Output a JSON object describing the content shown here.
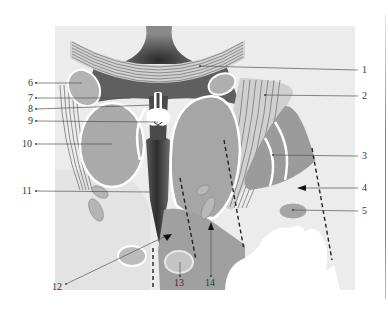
{
  "figure": {
    "colors": {
      "background_panel": "#ececec",
      "tissue_light": "#d9d9d9",
      "organ_gray": "#a9a9a9",
      "organ_dark": "#8c8c8c",
      "cavity_dark": "#3a3a3a",
      "outline_white": "#ffffff",
      "label_text": "#333333"
    },
    "callouts": [
      {
        "id": "1",
        "label": "1",
        "text_x": 362,
        "text_y": 73,
        "line": [
          [
            200,
            66
          ],
          [
            358,
            70
          ]
        ]
      },
      {
        "id": "2",
        "label": "2",
        "text_x": 362,
        "text_y": 99,
        "line": [
          [
            265,
            95
          ],
          [
            358,
            96
          ]
        ]
      },
      {
        "id": "3",
        "label": "3",
        "text_x": 362,
        "text_y": 159,
        "line": [
          [
            273,
            155
          ],
          [
            358,
            156
          ]
        ]
      },
      {
        "id": "4",
        "label": "4",
        "text_x": 362,
        "text_y": 191,
        "line": [
          [
            305,
            188
          ],
          [
            358,
            188
          ]
        ]
      },
      {
        "id": "5",
        "label": "5",
        "text_x": 362,
        "text_y": 214,
        "line": [
          [
            293,
            210
          ],
          [
            358,
            211
          ]
        ]
      },
      {
        "id": "6",
        "label": "6",
        "text_x": 28,
        "text_y": 86,
        "line": [
          [
            36,
            83
          ],
          [
            82,
            83
          ]
        ]
      },
      {
        "id": "7",
        "label": "7",
        "text_x": 28,
        "text_y": 101,
        "line": [
          [
            36,
            98
          ],
          [
            130,
            98
          ]
        ]
      },
      {
        "id": "8",
        "label": "8",
        "text_x": 28,
        "text_y": 112,
        "line": [
          [
            36,
            109
          ],
          [
            153,
            105
          ]
        ]
      },
      {
        "id": "9",
        "label": "9",
        "text_x": 28,
        "text_y": 124,
        "line": [
          [
            36,
            121
          ],
          [
            158,
            122
          ]
        ]
      },
      {
        "id": "10",
        "label": "10",
        "text_x": 22,
        "text_y": 147,
        "line": [
          [
            36,
            144
          ],
          [
            112,
            144
          ]
        ]
      },
      {
        "id": "11",
        "label": "11",
        "text_x": 22,
        "text_y": 194,
        "line": [
          [
            36,
            191
          ],
          [
            152,
            192
          ]
        ]
      },
      {
        "id": "12",
        "label": "12",
        "text_x": 52,
        "text_y": 290,
        "line": [
          [
            66,
            284
          ],
          [
            168,
            235
          ]
        ]
      },
      {
        "id": "13",
        "label": "13",
        "text_x": 174,
        "text_y": 286,
        "line": [
          [
            180,
            276
          ],
          [
            180,
            262
          ]
        ]
      },
      {
        "id": "14",
        "label": "14",
        "text_x": 205,
        "text_y": 286,
        "line": [
          [
            211,
            276
          ],
          [
            211,
            228
          ]
        ]
      }
    ]
  }
}
